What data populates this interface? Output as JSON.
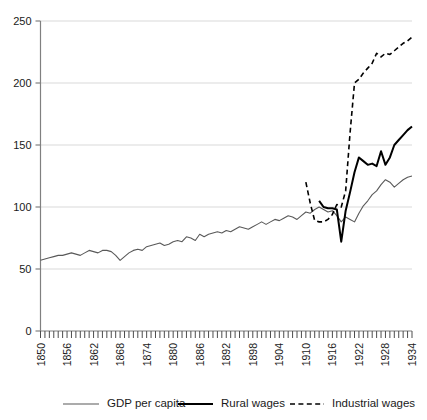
{
  "chart_data": {
    "type": "line",
    "title": "",
    "subtitle": "",
    "xlabel": "",
    "ylabel": "",
    "grid": "horizontal",
    "legend_position": "bottom",
    "ylim": [
      0,
      250
    ],
    "ytick_labels": [
      "0",
      "50",
      "100",
      "150",
      "200",
      "250"
    ],
    "yticks": [
      0,
      50,
      100,
      150,
      200,
      250
    ],
    "xlim": [
      1850,
      1934
    ],
    "xtick_labels": [
      "1850",
      "1856",
      "1862",
      "1868",
      "1874",
      "1880",
      "1886",
      "1892",
      "1898",
      "1904",
      "1910",
      "1916",
      "1922",
      "1928",
      "1934"
    ],
    "xticks": [
      1850,
      1856,
      1862,
      1868,
      1874,
      1880,
      1886,
      1892,
      1898,
      1904,
      1910,
      1916,
      1922,
      1928,
      1934
    ],
    "xtick_minor_every": 1,
    "series": [
      {
        "name": "GDP per capita",
        "style": "solid-thin",
        "color": "#595959",
        "x": [
          1850,
          1851,
          1852,
          1853,
          1854,
          1855,
          1856,
          1857,
          1858,
          1859,
          1860,
          1861,
          1862,
          1863,
          1864,
          1865,
          1866,
          1867,
          1868,
          1869,
          1870,
          1871,
          1872,
          1873,
          1874,
          1875,
          1876,
          1877,
          1878,
          1879,
          1880,
          1881,
          1882,
          1883,
          1884,
          1885,
          1886,
          1887,
          1888,
          1889,
          1890,
          1891,
          1892,
          1893,
          1894,
          1895,
          1896,
          1897,
          1898,
          1899,
          1900,
          1901,
          1902,
          1903,
          1904,
          1905,
          1906,
          1907,
          1908,
          1909,
          1910,
          1911,
          1912,
          1913,
          1914,
          1915,
          1916,
          1917,
          1918,
          1919,
          1920,
          1921,
          1922,
          1923,
          1924,
          1925,
          1926,
          1927,
          1928,
          1929,
          1930,
          1931,
          1932,
          1933,
          1934
        ],
        "values": [
          57,
          58,
          59,
          60,
          61,
          61,
          62,
          63,
          62,
          61,
          63,
          65,
          64,
          63,
          65,
          65,
          64,
          61,
          57,
          60,
          63,
          65,
          66,
          65,
          68,
          69,
          70,
          71,
          69,
          70,
          72,
          73,
          72,
          76,
          75,
          73,
          78,
          76,
          78,
          79,
          80,
          79,
          81,
          80,
          82,
          84,
          83,
          82,
          84,
          86,
          88,
          86,
          88,
          90,
          89,
          91,
          93,
          92,
          90,
          93,
          96,
          95,
          98,
          100,
          98,
          96,
          97,
          93,
          88,
          92,
          90,
          88,
          95,
          101,
          105,
          110,
          113,
          118,
          122,
          120,
          116,
          119,
          122,
          124,
          125
        ]
      },
      {
        "name": "Rural wages",
        "style": "solid-thick",
        "color": "#000000",
        "x": [
          1913,
          1914,
          1915,
          1916,
          1917,
          1918,
          1919,
          1920,
          1921,
          1922,
          1923,
          1924,
          1925,
          1926,
          1927,
          1928,
          1929,
          1930,
          1931,
          1932,
          1933,
          1934
        ],
        "values": [
          105,
          100,
          99,
          99,
          98,
          72,
          97,
          112,
          128,
          140,
          137,
          134,
          135,
          133,
          145,
          134,
          140,
          150,
          154,
          158,
          162,
          165
        ]
      },
      {
        "name": "Industrial wages",
        "style": "dashed",
        "color": "#000000",
        "x": [
          1910,
          1911,
          1912,
          1913,
          1914,
          1915,
          1916,
          1917,
          1918,
          1919,
          1920,
          1921,
          1922,
          1923,
          1924,
          1925,
          1926,
          1927,
          1928,
          1929,
          1930,
          1931,
          1932,
          1933,
          1934
        ],
        "values": [
          120,
          103,
          89,
          88,
          88,
          90,
          94,
          102,
          100,
          113,
          160,
          200,
          203,
          208,
          212,
          216,
          224,
          221,
          224,
          223,
          226,
          229,
          232,
          234,
          237
        ]
      }
    ]
  },
  "legend": {
    "items": [
      {
        "label": "GDP per capita",
        "style": "solid-thin"
      },
      {
        "label": "Rural wages",
        "style": "solid-thick"
      },
      {
        "label": "Industrial wages",
        "style": "dashed"
      }
    ]
  }
}
